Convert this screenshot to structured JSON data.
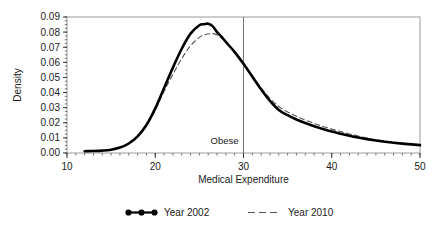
{
  "chart_data": {
    "type": "line",
    "title": "",
    "xlabel": "Medical Expenditure",
    "ylabel": "Density",
    "xlim": [
      10,
      50
    ],
    "ylim": [
      0.0,
      0.09
    ],
    "grid": false,
    "legend_position": "below",
    "x_ticks": [
      10,
      20,
      30,
      40,
      50
    ],
    "x_tick_labels": [
      "10",
      "20",
      "30",
      "40",
      "50"
    ],
    "x_minor_tick_step": 1,
    "y_ticks": [
      0.0,
      0.01,
      0.02,
      0.03,
      0.04,
      0.05,
      0.06,
      0.07,
      0.08,
      0.09
    ],
    "y_tick_labels": [
      "0.00",
      "0.01",
      "0.02",
      "0.03",
      "0.04",
      "0.05",
      "0.06",
      "0.07",
      "0.08",
      "0.09"
    ],
    "y_minor_tick_step": 0.0025,
    "annotations": [
      {
        "name": "obese-threshold",
        "label": "Obese",
        "type": "vline",
        "x": 30,
        "y_top": 0.09,
        "y_bottom": 0.0
      }
    ],
    "series": [
      {
        "name": "Year 2002",
        "style": "solid",
        "color": "#000000",
        "width": 2.6,
        "marker": "circle-line",
        "x": [
          12.0,
          13.0,
          14.0,
          15.0,
          16.0,
          17.0,
          18.0,
          19.0,
          20.0,
          21.0,
          22.0,
          23.0,
          24.0,
          25.0,
          25.5,
          26.0,
          26.5,
          27.0,
          27.5,
          28.0,
          29.0,
          30.0,
          31.0,
          32.0,
          33.0,
          34.0,
          35.0,
          36.0,
          37.0,
          38.0,
          39.0,
          40.0,
          41.0,
          42.0,
          43.0,
          44.0,
          45.0,
          46.0,
          47.0,
          48.0,
          49.0,
          50.0
        ],
        "y": [
          0.0012,
          0.0013,
          0.0016,
          0.0022,
          0.0036,
          0.0063,
          0.011,
          0.0185,
          0.0295,
          0.043,
          0.0565,
          0.069,
          0.079,
          0.0845,
          0.0852,
          0.0856,
          0.084,
          0.08,
          0.077,
          0.0735,
          0.0668,
          0.059,
          0.0505,
          0.042,
          0.0345,
          0.0285,
          0.025,
          0.0222,
          0.0198,
          0.0177,
          0.0158,
          0.0142,
          0.0128,
          0.0114,
          0.0102,
          0.0092,
          0.0083,
          0.0075,
          0.0068,
          0.0062,
          0.0057,
          0.0052
        ]
      },
      {
        "name": "Year 2010",
        "style": "dashed",
        "color": "#555555",
        "width": 1.1,
        "marker": "dashed-line",
        "x": [
          12.0,
          13.0,
          14.0,
          15.0,
          16.0,
          17.0,
          18.0,
          19.0,
          20.0,
          21.0,
          22.0,
          23.0,
          24.0,
          25.0,
          25.5,
          26.0,
          26.5,
          27.0,
          27.5,
          28.0,
          29.0,
          30.0,
          31.0,
          32.0,
          33.0,
          34.0,
          35.0,
          36.0,
          37.0,
          38.0,
          39.0,
          40.0,
          41.0,
          42.0,
          43.0,
          44.0,
          45.0,
          46.0,
          47.0,
          48.0,
          49.0,
          50.0
        ],
        "y": [
          0.0012,
          0.0013,
          0.0016,
          0.0022,
          0.0036,
          0.0062,
          0.0108,
          0.018,
          0.0285,
          0.0408,
          0.052,
          0.0625,
          0.071,
          0.0765,
          0.078,
          0.0788,
          0.079,
          0.0782,
          0.0762,
          0.0735,
          0.0672,
          0.0595,
          0.0512,
          0.0432,
          0.0362,
          0.0308,
          0.0272,
          0.0243,
          0.0218,
          0.0196,
          0.0176,
          0.0158,
          0.0142,
          0.0126,
          0.0112,
          0.0099,
          0.0088,
          0.0079,
          0.0071,
          0.0064,
          0.0058,
          0.0053
        ]
      }
    ]
  },
  "legend": {
    "items": [
      {
        "label": "Year 2002",
        "marker": "dot-line-marker"
      },
      {
        "label": "Year 2010",
        "marker": "dashed-line-marker"
      }
    ]
  }
}
